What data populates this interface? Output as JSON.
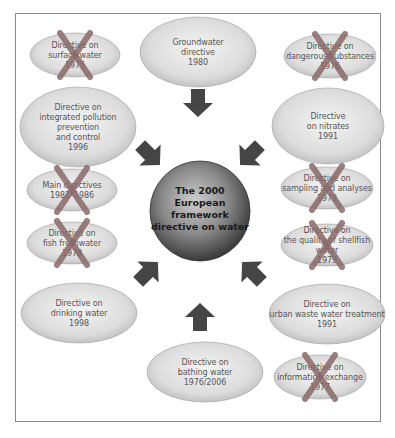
{
  "center": {
    "lines": [
      "The 2000",
      "European",
      "framework",
      "directive on water"
    ]
  },
  "directives": [
    {
      "id": "surface-water",
      "lines": [
        "Directive on",
        "surface water",
        "1975"
      ],
      "repealed": true
    },
    {
      "id": "groundwater",
      "lines": [
        "Groundwater",
        "directive",
        "1980"
      ],
      "repealed": false
    },
    {
      "id": "dangerous-substances",
      "lines": [
        "Directive on",
        "dangerous substances",
        "1976"
      ],
      "repealed": true
    },
    {
      "id": "ippc",
      "lines": [
        "Directive on",
        "integrated pollution",
        "prevention",
        "and control",
        "1996"
      ],
      "repealed": false
    },
    {
      "id": "nitrates",
      "lines": [
        "Directive",
        "on nitrates",
        "1991"
      ],
      "repealed": false
    },
    {
      "id": "main-directives",
      "lines": [
        "Main directives",
        "1981–1986"
      ],
      "repealed": true
    },
    {
      "id": "sampling-analyses",
      "lines": [
        "Directive on",
        "sampling and analyses",
        "1979"
      ],
      "repealed": true
    },
    {
      "id": "fish-freshwater",
      "lines": [
        "Directive on",
        "fish freshwater",
        "1978"
      ],
      "repealed": true
    },
    {
      "id": "shellfish-water",
      "lines": [
        "Directive on",
        "the quality of shellfish",
        "water",
        "1979"
      ],
      "repealed": true
    },
    {
      "id": "drinking-water",
      "lines": [
        "Directive on",
        "drinking water",
        "1998"
      ],
      "repealed": false
    },
    {
      "id": "urban-waste-water",
      "lines": [
        "Directive on",
        "urban waste water treatment",
        "1991"
      ],
      "repealed": false
    },
    {
      "id": "bathing-water",
      "lines": [
        "Directive on",
        "bathing water",
        "1976/2006"
      ],
      "repealed": false
    },
    {
      "id": "information-exchange",
      "lines": [
        "Directive on",
        "information exchange",
        "1977"
      ],
      "repealed": true
    }
  ],
  "arrows": [
    {
      "id": "from-top",
      "direction": "down"
    },
    {
      "id": "from-top-left",
      "direction": "down-right"
    },
    {
      "id": "from-top-right",
      "direction": "down-left"
    },
    {
      "id": "from-bottom-left",
      "direction": "up-right"
    },
    {
      "id": "from-bottom-right",
      "direction": "up-left"
    },
    {
      "id": "from-bottom",
      "direction": "up"
    }
  ],
  "colors": {
    "ellipse_light": "#ececec",
    "ellipse_dark": "#b8b8b8",
    "cross": "#8a6a6a",
    "arrow": "#454545",
    "center_light": "#c8c8c8",
    "center_dark": "#3a3a3a"
  }
}
